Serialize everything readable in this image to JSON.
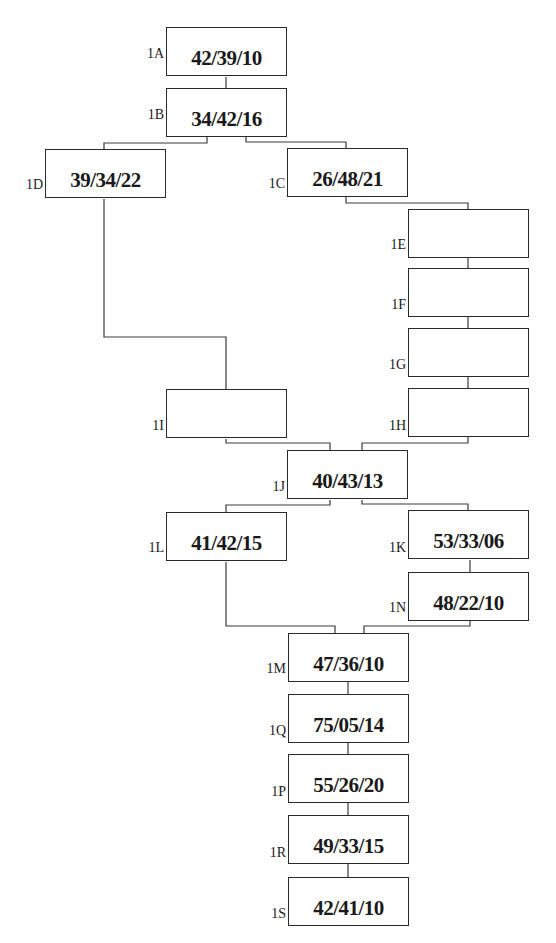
{
  "diagram": {
    "type": "flowchart",
    "nodes": [
      {
        "id": "1A",
        "label": "1A",
        "value": "42/39/10",
        "x": 166,
        "y": 27
      },
      {
        "id": "1B",
        "label": "1B",
        "value": "34/42/16",
        "x": 166,
        "y": 88
      },
      {
        "id": "1D",
        "label": "1D",
        "value": "39/34/22",
        "x": 45,
        "y": 149
      },
      {
        "id": "1C",
        "label": "1C",
        "value": "26/48/21",
        "x": 287,
        "y": 148
      },
      {
        "id": "1E",
        "label": "1E",
        "value": "",
        "x": 408,
        "y": 209
      },
      {
        "id": "1F",
        "label": "1F",
        "value": "",
        "x": 408,
        "y": 268
      },
      {
        "id": "1G",
        "label": "1G",
        "value": "",
        "x": 408,
        "y": 328
      },
      {
        "id": "1H",
        "label": "1H",
        "value": "",
        "x": 408,
        "y": 388
      },
      {
        "id": "1I",
        "label": "1I",
        "value": "",
        "x": 166,
        "y": 389
      },
      {
        "id": "1J",
        "label": "1J",
        "value": "40/43/13",
        "x": 287,
        "y": 450
      },
      {
        "id": "1L",
        "label": "1L",
        "value": "41/42/15",
        "x": 166,
        "y": 512
      },
      {
        "id": "1K",
        "label": "1K",
        "value": "53/33/06",
        "x": 408,
        "y": 510
      },
      {
        "id": "1N",
        "label": "1N",
        "value": "48/22/10",
        "x": 408,
        "y": 572
      },
      {
        "id": "1M",
        "label": "1M",
        "value": "47/36/10",
        "x": 288,
        "y": 633
      },
      {
        "id": "1Q",
        "label": "1Q",
        "value": "75/05/14",
        "x": 288,
        "y": 694
      },
      {
        "id": "1P",
        "label": "1P",
        "value": "55/26/20",
        "x": 288,
        "y": 754
      },
      {
        "id": "1R",
        "label": "1R",
        "value": "49/33/15",
        "x": 288,
        "y": 815
      },
      {
        "id": "1S",
        "label": "1S",
        "value": "42/41/10",
        "x": 288,
        "y": 877
      }
    ],
    "edges": [
      [
        "1A",
        "1B"
      ],
      [
        "1B",
        "1D"
      ],
      [
        "1B",
        "1C"
      ],
      [
        "1C",
        "1E"
      ],
      [
        "1E",
        "1F"
      ],
      [
        "1F",
        "1G"
      ],
      [
        "1G",
        "1H"
      ],
      [
        "1D",
        "1I"
      ],
      [
        "1I",
        "1J"
      ],
      [
        "1H",
        "1J"
      ],
      [
        "1J",
        "1L"
      ],
      [
        "1J",
        "1K"
      ],
      [
        "1K",
        "1N"
      ],
      [
        "1L",
        "1M"
      ],
      [
        "1N",
        "1M"
      ],
      [
        "1M",
        "1Q"
      ],
      [
        "1Q",
        "1P"
      ],
      [
        "1P",
        "1R"
      ],
      [
        "1R",
        "1S"
      ]
    ]
  }
}
